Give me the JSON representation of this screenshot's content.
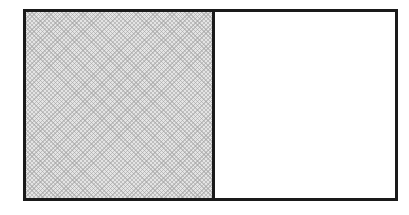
{
  "diagram": {
    "type": "fraction-rectangle",
    "parts_total": 2,
    "parts_shaded": 1,
    "shaded_side": "left",
    "colors": {
      "border": "#1a1a1a",
      "shaded_fill": "#e4e4e4",
      "shading_pattern": "#a0a0a0",
      "unshaded_fill": "#ffffff"
    }
  }
}
